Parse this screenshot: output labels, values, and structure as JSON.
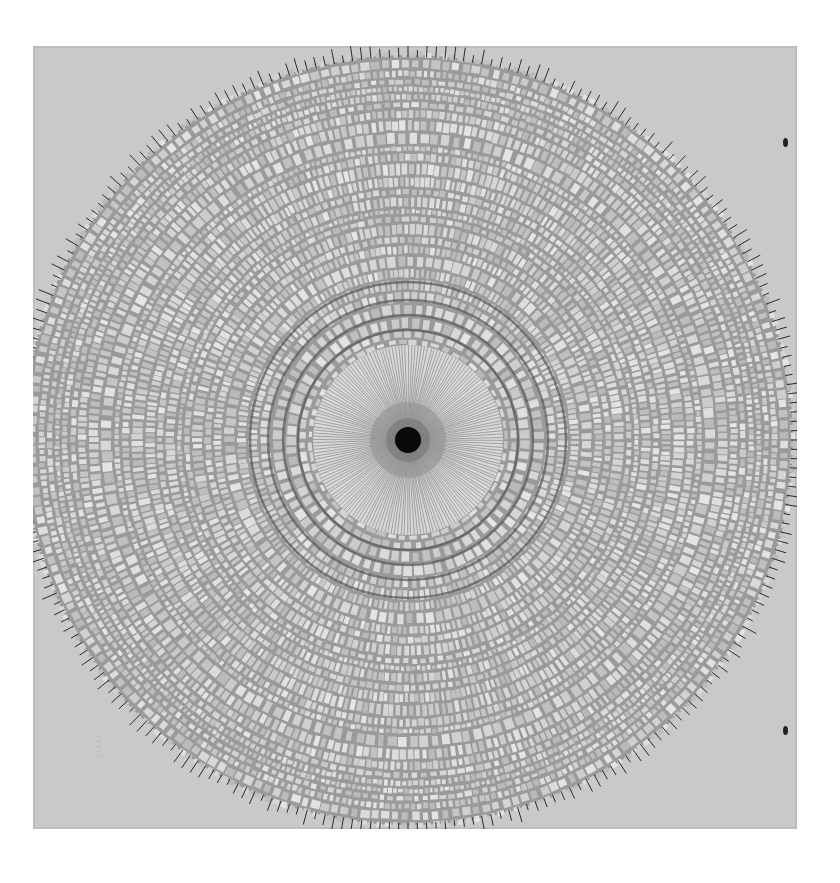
{
  "image": {
    "subject": "shattered glass pane with bullet hole",
    "description": "Black-and-white photograph of a square glass plate shattered by a projectile; dense radial and concentric fracture pattern around a small central hole",
    "colors": {
      "background": "#ffffff",
      "plate": "#c9c9c9",
      "fragment_light": "#d8d8d8",
      "crack_dark": "#2a2a2a",
      "hole": "#0a0a0a"
    },
    "features": {
      "central_hole": {
        "cx": 408,
        "cy": 440,
        "r": 13
      },
      "radial_zone_radius": 95,
      "shatter_radius": 385,
      "corner_stamp_lines": [
        "····",
        "····",
        "····",
        "····",
        "····"
      ]
    }
  }
}
